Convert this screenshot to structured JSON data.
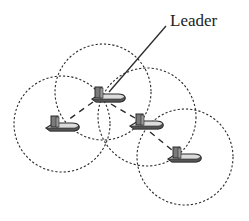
{
  "diagram": {
    "label": "Leader",
    "colors": {
      "stroke": "#2a2a2a",
      "boat_hull": "#6e6e6e",
      "boat_deck": "#d8d8d8",
      "background": "#ffffff"
    },
    "nodes": [
      {
        "id": "leader",
        "role": "leader",
        "x": 103,
        "y": 100,
        "range_radius": 48
      },
      {
        "id": "follower-left",
        "role": "follower",
        "x": 60,
        "y": 126,
        "range_radius": 47
      },
      {
        "id": "follower-middle",
        "role": "follower",
        "x": 148,
        "y": 120,
        "range_radius": 47
      },
      {
        "id": "follower-bottom",
        "role": "follower",
        "x": 183,
        "y": 156,
        "range_radius": 48
      }
    ],
    "links": [
      {
        "from": "leader",
        "to": "follower-left"
      },
      {
        "from": "leader",
        "to": "follower-middle"
      },
      {
        "from": "follower-middle",
        "to": "follower-bottom"
      }
    ]
  }
}
